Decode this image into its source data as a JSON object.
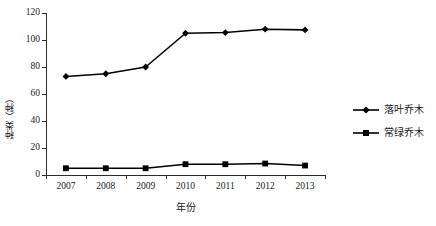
{
  "chart_data": {
    "type": "line",
    "title": "",
    "xlabel": "年份",
    "ylabel": "种类（种）",
    "categories": [
      "2007",
      "2008",
      "2009",
      "2010",
      "2011",
      "2012",
      "2013"
    ],
    "series": [
      {
        "name": "落叶乔木",
        "marker": "diamond",
        "color": "#000000",
        "values": [
          73,
          75,
          80,
          105,
          105.5,
          108,
          107.5
        ]
      },
      {
        "name": "常绿乔木",
        "marker": "square",
        "color": "#000000",
        "values": [
          5,
          5,
          5,
          8,
          8,
          8.5,
          7
        ]
      }
    ],
    "ylim": [
      0,
      120
    ],
    "yticks": [
      0,
      20,
      40,
      60,
      80,
      100,
      120
    ],
    "ytick_labels": [
      "0",
      "20",
      "40",
      "60",
      "80",
      "100",
      "120"
    ],
    "grid": false,
    "legend_position": "right"
  },
  "legend": {
    "items": [
      {
        "label": "落叶乔木"
      },
      {
        "label": "常绿乔木"
      }
    ]
  },
  "axes": {
    "x_title": "年份",
    "y_title": "种类（种）"
  }
}
